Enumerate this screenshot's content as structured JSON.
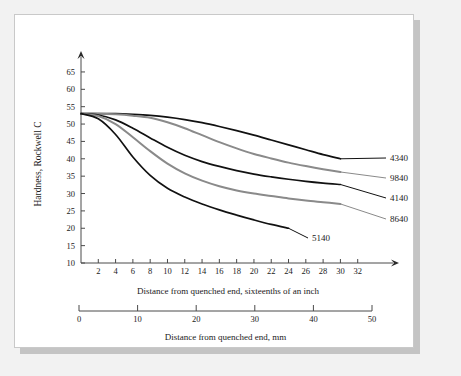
{
  "figure": {
    "background_color": "#f2f2f2",
    "card_color": "#ffffff",
    "shadow_color": "#c4c4c4"
  },
  "chart_data": {
    "type": "line",
    "title": "",
    "xlabel": "Distance from quenched end, sixteenths of an inch",
    "xlabel_secondary": "Distance from quenched end, mm",
    "ylabel": "Hardness, Rockwell C",
    "xlim": [
      0,
      34
    ],
    "ylim": [
      10,
      67
    ],
    "grid": false,
    "legend_position": "right-inline-labels",
    "y_ticks": [
      10,
      15,
      20,
      25,
      30,
      35,
      40,
      45,
      50,
      55,
      60,
      65
    ],
    "x_ticks": [
      2,
      4,
      6,
      8,
      10,
      12,
      14,
      16,
      18,
      20,
      22,
      24,
      26,
      28,
      30,
      32
    ],
    "x_ticks_mm": [
      0,
      10,
      20,
      30,
      40,
      50
    ],
    "x_mm_max": 50,
    "series": [
      {
        "name": "4340",
        "color": "#111111",
        "width": 1.7,
        "label": "4340",
        "label_x": 375,
        "label_y": 146,
        "x": [
          0,
          2,
          4,
          6,
          8,
          10,
          12,
          14,
          16,
          18,
          20,
          22,
          24,
          26,
          28,
          30
        ],
        "y": [
          53,
          53,
          53,
          52.8,
          52.5,
          52,
          51.3,
          50.4,
          49.3,
          48.1,
          46.8,
          45.4,
          44.0,
          42.6,
          41.2,
          40.0
        ]
      },
      {
        "name": "9840",
        "color": "#8a8a8a",
        "width": 2.0,
        "label": "9840",
        "label_x": 375,
        "label_y": 166,
        "x": [
          0,
          2,
          4,
          6,
          8,
          10,
          12,
          14,
          16,
          18,
          20,
          22,
          24,
          26,
          28,
          30
        ],
        "y": [
          53,
          53,
          52.8,
          52.4,
          51.8,
          50.5,
          48.8,
          46.8,
          44.8,
          43.0,
          41.4,
          40.1,
          38.9,
          37.9,
          37.0,
          36.2
        ]
      },
      {
        "name": "4140",
        "color": "#111111",
        "width": 1.7,
        "label": "4140",
        "label_x": 375,
        "label_y": 186,
        "x": [
          0,
          2,
          4,
          6,
          8,
          10,
          12,
          14,
          16,
          18,
          20,
          22,
          24,
          26,
          28,
          30
        ],
        "y": [
          53,
          52.6,
          51.2,
          48.8,
          46.0,
          43.3,
          41.0,
          39.2,
          37.8,
          36.6,
          35.6,
          34.8,
          34.1,
          33.5,
          33.0,
          32.6
        ]
      },
      {
        "name": "8640",
        "color": "#8a8a8a",
        "width": 2.0,
        "label": "8640",
        "label_x": 375,
        "label_y": 207,
        "x": [
          0,
          2,
          4,
          6,
          8,
          10,
          12,
          14,
          16,
          18,
          20,
          22,
          24,
          26,
          28,
          30
        ],
        "y": [
          53,
          52.3,
          50.0,
          46.2,
          42.2,
          38.6,
          35.8,
          33.7,
          32.1,
          30.9,
          30.0,
          29.3,
          28.6,
          28.0,
          27.5,
          27.0
        ]
      },
      {
        "name": "5140",
        "color": "#111111",
        "width": 1.7,
        "label": "5140",
        "label_x": 297,
        "label_y": 226,
        "x": [
          0,
          2,
          4,
          6,
          8,
          10,
          12,
          14,
          16,
          18,
          20,
          22,
          24
        ],
        "y": [
          53,
          51.5,
          47.0,
          40.5,
          35.2,
          31.5,
          29.0,
          27.0,
          25.3,
          23.8,
          22.4,
          21.1,
          20.0
        ]
      }
    ]
  }
}
